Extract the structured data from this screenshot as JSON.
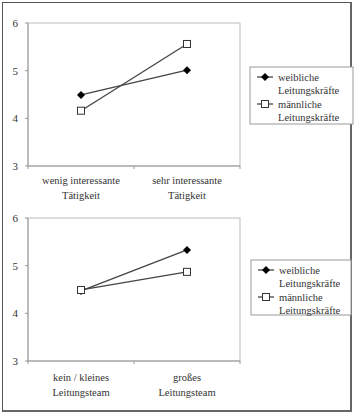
{
  "chart_data": [
    {
      "type": "line",
      "title": "",
      "xlabel": "",
      "ylabel": "",
      "ylim": [
        3,
        6
      ],
      "yticks": [
        3,
        4,
        5,
        6
      ],
      "categories": [
        "wenig interessante Tätigkeit",
        "sehr interessante Tätigkeit"
      ],
      "category_lines": [
        [
          "wenig interessante",
          "Tätigkeit"
        ],
        [
          "sehr interessante",
          "Tätigkeit"
        ]
      ],
      "series": [
        {
          "name": "weibliche Leitungskräfte",
          "legend_lines": [
            "weibliche",
            "Leitungskräfte"
          ],
          "marker": "diamond-filled",
          "values": [
            4.49,
            5.01
          ]
        },
        {
          "name": "männliche Leitungskräfte",
          "legend_lines": [
            "männliche",
            "Leitungskräfte"
          ],
          "marker": "square-open",
          "values": [
            4.16,
            5.56
          ]
        }
      ],
      "grid": false,
      "legend_position": "right"
    },
    {
      "type": "line",
      "title": "",
      "xlabel": "",
      "ylabel": "",
      "ylim": [
        3,
        6
      ],
      "yticks": [
        3,
        4,
        5,
        6
      ],
      "categories": [
        "kein / kleines Leitungsteam",
        "großes Leitungsteam"
      ],
      "category_lines": [
        [
          "kein / kleines",
          "Leitungsteam"
        ],
        [
          "großes",
          "Leitungsteam"
        ]
      ],
      "series": [
        {
          "name": "weibliche Leitungskräfte",
          "legend_lines": [
            "weibliche",
            "Leitungskräfte"
          ],
          "marker": "diamond-filled",
          "values": [
            4.47,
            5.33
          ]
        },
        {
          "name": "männliche Leitungskräfte",
          "legend_lines": [
            "männliche",
            "Leitungskräfte"
          ],
          "marker": "square-open",
          "values": [
            4.49,
            4.87
          ]
        }
      ],
      "grid": false,
      "legend_position": "right"
    }
  ],
  "colors": {
    "line": "#444444",
    "axis": "#999999",
    "text": "#333333"
  }
}
